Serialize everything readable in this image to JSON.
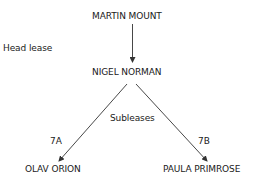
{
  "diagram": {
    "nodes": {
      "top": "MARTIN MOUNT",
      "middle": "NIGEL NORMAN",
      "left": "OLAV ORION",
      "right": "PAULA PRIMROSE"
    },
    "labels": {
      "head_lease": "Head lease",
      "subleases": "Subleases",
      "left_edge": "7A",
      "right_edge": "7B"
    },
    "colors": {
      "text": "#1a1a1a",
      "line": "#333333"
    }
  }
}
